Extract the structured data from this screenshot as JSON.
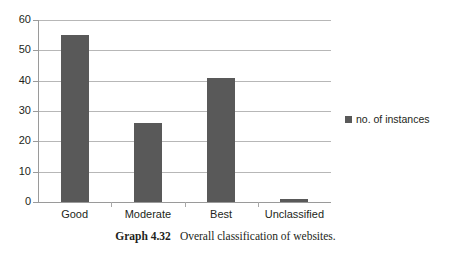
{
  "chart_data": {
    "type": "bar",
    "title": "",
    "subtitle": "",
    "xlabel": "",
    "ylabel": "",
    "categories": [
      "Good",
      "Moderate",
      "Best",
      "Unclassified"
    ],
    "values": [
      55,
      26,
      41,
      1
    ],
    "series": [
      {
        "name": "no. of instances",
        "values": [
          55,
          26,
          41,
          1
        ],
        "color": "#595959"
      }
    ],
    "ylim": [
      0,
      60
    ],
    "ytick_labels": [
      "0",
      "10",
      "20",
      "30",
      "40",
      "50",
      "60"
    ],
    "ytick_values": [
      0,
      10,
      20,
      30,
      40,
      50,
      60
    ],
    "grid": true,
    "grid_axis": "y",
    "legend_position": "right",
    "bar_color": "#595959",
    "gridline_color": "#b7b7b7",
    "axis_color": "#9a9a9a",
    "background_color": "#ffffff"
  },
  "legend": {
    "entries": [
      {
        "label": "no. of instances",
        "color": "#595959"
      }
    ]
  },
  "caption": {
    "label": "Graph 4.32",
    "text": "Overall classification of websites."
  }
}
